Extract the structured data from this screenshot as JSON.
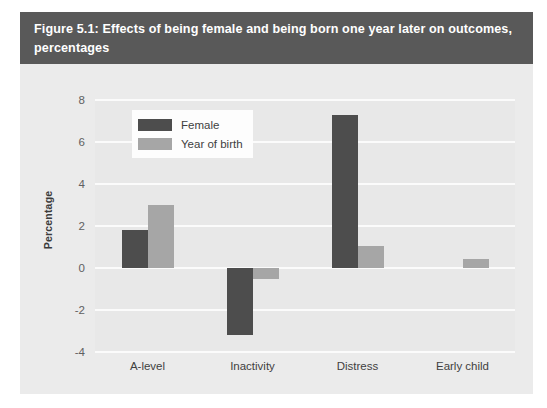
{
  "figure": {
    "title": "Figure 5.1: Effects of being female and being born one year later on outcomes, percentages",
    "title_bar_color": "#595959",
    "panel_color": "#ebebeb",
    "plot_color": "#e8e8e8"
  },
  "chart_data": {
    "type": "bar",
    "title": "Figure 5.1: Effects of being female and being born one year later on outcomes, percentages",
    "xlabel": "",
    "ylabel": "Percentage",
    "categories": [
      "A-level",
      "Inactivity",
      "Distress",
      "Early child"
    ],
    "series": [
      {
        "name": "Female",
        "color": "#4d4d4d",
        "values": [
          1.8,
          -3.2,
          7.3,
          0
        ]
      },
      {
        "name": "Year of birth",
        "color": "#a6a6a6",
        "values": [
          3.0,
          -0.5,
          1.05,
          0.45
        ]
      }
    ],
    "ylim": [
      -4,
      8
    ],
    "yticks": [
      8,
      6,
      4,
      2,
      0,
      -2,
      -4
    ],
    "ytick_labels": [
      "8",
      "6",
      "4",
      "2",
      "0",
      "-2",
      "-4"
    ],
    "grid": true,
    "grid_color": "#fbfbfb",
    "legend_position": "upper left"
  },
  "legend": {
    "entries": [
      {
        "label": "Female",
        "color": "#4d4d4d"
      },
      {
        "label": "Year of birth",
        "color": "#a6a6a6"
      }
    ]
  }
}
